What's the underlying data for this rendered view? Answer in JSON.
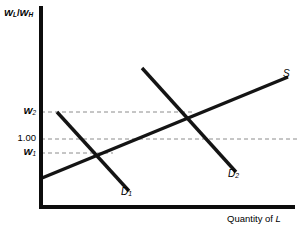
{
  "chart_data": {
    "type": "line",
    "title": "",
    "subtitle": "",
    "xlabel": "Quantity of L",
    "ylabel": "W_L/W_H",
    "ylabel_parts": {
      "w1": "W",
      "sub1": "L",
      "slash": "/",
      "w2": "W",
      "sub2": "H"
    },
    "xlabel_parts": {
      "text": "Quantity of ",
      "italic": "L"
    },
    "grid": false,
    "legend_position": "inline-curve-labels",
    "xlim": [
      0,
      100
    ],
    "ylim": [
      0,
      100
    ],
    "axis_ticks_x": [],
    "y_tick_labels": [
      {
        "id": "w2",
        "text": "W",
        "sub": "2",
        "is_numeric": false,
        "y_px": 112
      },
      {
        "id": "one",
        "text": "1.00",
        "sub": "",
        "is_numeric": true,
        "y_px": 139
      },
      {
        "id": "w1",
        "text": "W",
        "sub": "1",
        "is_numeric": false,
        "y_px": 153
      }
    ],
    "guide_lines": [
      {
        "id": "guide-w2",
        "label": "W2",
        "y_px": 112,
        "x_start_px": 41,
        "x_end_px": 192
      },
      {
        "id": "guide-one",
        "label": "1.00",
        "y_px": 139,
        "x_start_px": 41,
        "x_end_px": 297
      },
      {
        "id": "guide-w1",
        "label": "W1",
        "y_px": 153,
        "x_start_px": 41,
        "x_end_px": 113
      }
    ],
    "series": [
      {
        "name": "S",
        "label": "S",
        "label_sub": "",
        "kind": "supply",
        "slope": "upward",
        "points_px": [
          [
            42,
            178
          ],
          [
            288,
            77
          ]
        ],
        "label_pos_px": [
          283,
          69
        ]
      },
      {
        "name": "D1",
        "label": "D",
        "label_sub": "1",
        "kind": "demand",
        "slope": "downward",
        "points_px": [
          [
            57,
            112
          ],
          [
            129,
            191
          ]
        ],
        "label_pos_px": [
          122,
          189
        ]
      },
      {
        "name": "D2",
        "label": "D",
        "label_sub": "2",
        "kind": "demand",
        "slope": "downward",
        "points_px": [
          [
            142,
            68
          ],
          [
            236,
            172
          ]
        ],
        "label_pos_px": [
          229,
          171
        ]
      }
    ],
    "equilibria": [
      {
        "id": "eq1",
        "curves": [
          "S",
          "D1"
        ],
        "x_px": 113,
        "y_px": 153,
        "wage_ratio_label": "W1"
      },
      {
        "id": "eq2",
        "curves": [
          "S",
          "D2"
        ],
        "x_px": 192,
        "y_px": 112,
        "wage_ratio_label": "W2"
      }
    ],
    "axes_px": {
      "y_axis_x": 41,
      "y_axis_top": 6,
      "y_axis_bottom": 207,
      "x_axis_y": 207,
      "x_axis_left": 41,
      "x_axis_right": 295
    },
    "colors": {
      "axis": "#0d0d0d",
      "curve": "#141414",
      "guide": "#8c8c8c",
      "background": "#ffffff",
      "text": "#000000"
    }
  },
  "labels": {
    "y_axis_title_w": "W",
    "y_axis_title_sub_l": "L",
    "y_axis_title_slash": "/",
    "y_axis_title_w2": "W",
    "y_axis_title_sub_h": "H",
    "x_axis_title_text": "Quantity of ",
    "x_axis_title_italic": "L",
    "tick_w2_main": "W",
    "tick_w2_sub": "2",
    "tick_one": "1.00",
    "tick_w1_main": "W",
    "tick_w1_sub": "1",
    "curve_s": "S",
    "curve_d1_main": "D",
    "curve_d1_sub": "1",
    "curve_d2_main": "D",
    "curve_d2_sub": "2"
  }
}
